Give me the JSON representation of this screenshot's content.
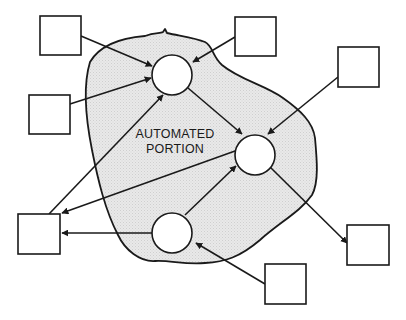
{
  "diagram": {
    "label_line1": "AUTOMATED",
    "label_line2": "PORTION",
    "colors": {
      "stroke": "#1a1a1a",
      "region_fill": "#e6e6e6",
      "node_fill": "#ffffff",
      "background": "#ffffff"
    },
    "processes": [
      {
        "id": "p1",
        "cx": 172,
        "cy": 75,
        "r": 20
      },
      {
        "id": "p2",
        "cx": 255,
        "cy": 155,
        "r": 20
      },
      {
        "id": "p3",
        "cx": 172,
        "cy": 233,
        "r": 20
      }
    ],
    "externals": [
      {
        "id": "e1",
        "x": 40,
        "y": 16,
        "w": 41,
        "h": 39
      },
      {
        "id": "e2",
        "x": 29,
        "y": 95,
        "w": 41,
        "h": 39
      },
      {
        "id": "e3",
        "x": 235,
        "y": 17,
        "w": 41,
        "h": 39
      },
      {
        "id": "e4",
        "x": 338,
        "y": 47,
        "w": 41,
        "h": 40
      },
      {
        "id": "e5",
        "x": 18,
        "y": 214,
        "w": 42,
        "h": 40
      },
      {
        "id": "e6",
        "x": 347,
        "y": 225,
        "w": 42,
        "h": 40
      },
      {
        "id": "e7",
        "x": 265,
        "y": 264,
        "w": 41,
        "h": 40
      }
    ],
    "flows": [
      {
        "from": "e1",
        "to": "p1"
      },
      {
        "from": "e2",
        "to": "p1"
      },
      {
        "from": "e3",
        "to": "p1"
      },
      {
        "from": "e5",
        "to": "p1"
      },
      {
        "from": "p1",
        "to": "p2"
      },
      {
        "from": "e4",
        "to": "p2"
      },
      {
        "from": "p3",
        "to": "p2"
      },
      {
        "from": "p2",
        "to": "e5"
      },
      {
        "from": "p2",
        "to": "e6"
      },
      {
        "from": "p3",
        "to": "e5"
      },
      {
        "from": "e7",
        "to": "p3"
      }
    ]
  }
}
